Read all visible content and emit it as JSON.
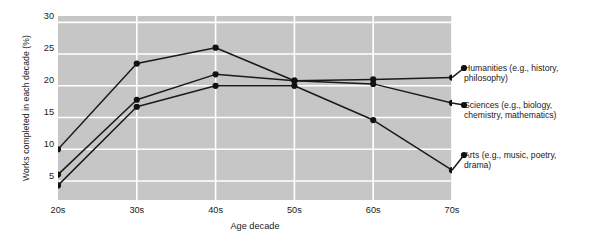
{
  "chart_data": {
    "type": "line",
    "title": "",
    "xlabel": "Age decade",
    "ylabel": "Works completed in each decade (%)",
    "categories": [
      "20s",
      "30s",
      "40s",
      "50s",
      "60s",
      "70s"
    ],
    "yticks": [
      5,
      10,
      15,
      20,
      25,
      30
    ],
    "ylim": [
      2,
      31
    ],
    "grid": true,
    "legend_position": "right",
    "plot_background": "#c6c6c6",
    "line_color": "#1a1a1a",
    "marker_color": "#111111",
    "series": [
      {
        "name": "Humanities (e.g., history, philosophy)",
        "values": [
          10,
          23.5,
          26,
          20.8,
          21,
          21.3
        ]
      },
      {
        "name": "Sciences (e.g., biology, chemistry, mathematics)",
        "values": [
          6,
          17.8,
          21.8,
          20.8,
          20.3,
          17.3
        ]
      },
      {
        "name": "Arts (e.g., music, poetry, drama)",
        "values": [
          4.3,
          16.7,
          20,
          20,
          14.6,
          6.7
        ]
      }
    ]
  },
  "legend": {
    "entries": [
      {
        "label_line1": "Humanities (e.g., history,",
        "label_line2": "philosophy)"
      },
      {
        "label_line1": "Sciences (e.g., biology,",
        "label_line2": "chemistry, mathematics)"
      },
      {
        "label_line1": "Arts (e.g., music, poetry,",
        "label_line2": "drama)"
      }
    ]
  },
  "axes": {
    "y_title": "Works completed in each decade (%)",
    "x_title": "Age decade",
    "y_tick_labels": [
      "30",
      "25",
      "20",
      "15",
      "10",
      "5"
    ],
    "x_tick_labels": [
      "20s",
      "30s",
      "40s",
      "50s",
      "60s",
      "70s"
    ]
  }
}
